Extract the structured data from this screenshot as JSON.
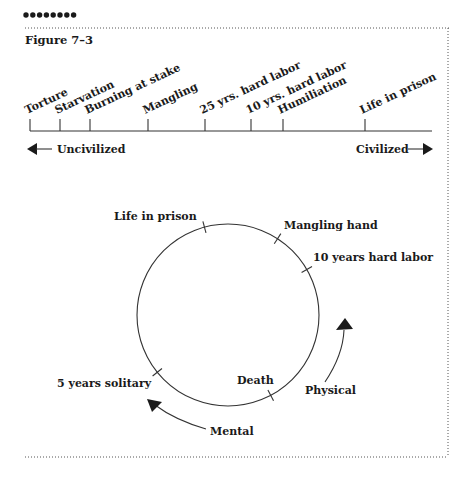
{
  "header": {
    "bullets": 8,
    "figure_label": "Figure 7–3"
  },
  "scale": {
    "left_label": "Uncivilized",
    "right_label": "Civilized",
    "ticks": [
      {
        "label": "Torture",
        "x": 30
      },
      {
        "label": "Starvation",
        "x": 60
      },
      {
        "label": "Burning at stake",
        "x": 90
      },
      {
        "label": "Mangling",
        "x": 148
      },
      {
        "label": "25 yrs. hard labor",
        "x": 205
      },
      {
        "label": "10 yrs. hard labor",
        "x": 251
      },
      {
        "label": "Humiliation",
        "x": 283
      },
      {
        "label": "Life in prison",
        "x": 365
      }
    ]
  },
  "circle": {
    "points": [
      {
        "label": "Life in prison",
        "angle": -105,
        "lx": 114,
        "ly": 220
      },
      {
        "label": "Mangling hand",
        "angle": -57,
        "lx": 284,
        "ly": 229
      },
      {
        "label": "10 years hard labor",
        "angle": -30,
        "lx": 313,
        "ly": 261
      },
      {
        "label": "5 years solitary",
        "angle": 141,
        "lx": 57,
        "ly": 387
      },
      {
        "label": "Death",
        "angle": 62,
        "lx": 237,
        "ly": 384
      }
    ],
    "arrows": {
      "physical_label": "Physical",
      "mental_label": "Mental"
    }
  }
}
